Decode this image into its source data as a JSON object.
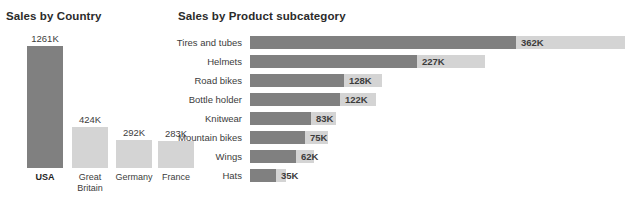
{
  "colors": {
    "bar_dark": "#808080",
    "bar_light": "#d4d4d4",
    "text": "#3c3c3c",
    "title": "#2b2b2b",
    "background": "#ffffff"
  },
  "chart_data": [
    {
      "type": "bar",
      "orientation": "vertical",
      "title": "Sales by Country",
      "xlabel": "",
      "ylabel": "",
      "grid": false,
      "legend": "none",
      "ylim": [
        0,
        1261
      ],
      "categories": [
        "USA",
        "Great Britain",
        "Germany",
        "France"
      ],
      "values": [
        1261,
        424,
        292,
        283
      ],
      "value_labels": [
        "1261K",
        "424K",
        "292K",
        "283K"
      ],
      "highlight_index": 0,
      "bar_colors": [
        "#808080",
        "#d4d4d4",
        "#d4d4d4",
        "#d4d4d4"
      ]
    },
    {
      "type": "bar",
      "orientation": "horizontal",
      "title": "Sales by Product subcategory",
      "xlabel": "",
      "ylabel": "",
      "grid": false,
      "legend": "none",
      "xlim": [
        0,
        510
      ],
      "categories": [
        "Tires and tubes",
        "Helmets",
        "Road bikes",
        "Bottle holder",
        "Knitwear",
        "Mountain bikes",
        "Wings",
        "Hats"
      ],
      "values": [
        362,
        227,
        128,
        122,
        83,
        75,
        62,
        35
      ],
      "value_labels": [
        "362K",
        "227K",
        "128K",
        "122K",
        "83K",
        "75K",
        "62K",
        "35K"
      ],
      "track_values": [
        510,
        320,
        180,
        172,
        117,
        106,
        87,
        49
      ]
    }
  ]
}
